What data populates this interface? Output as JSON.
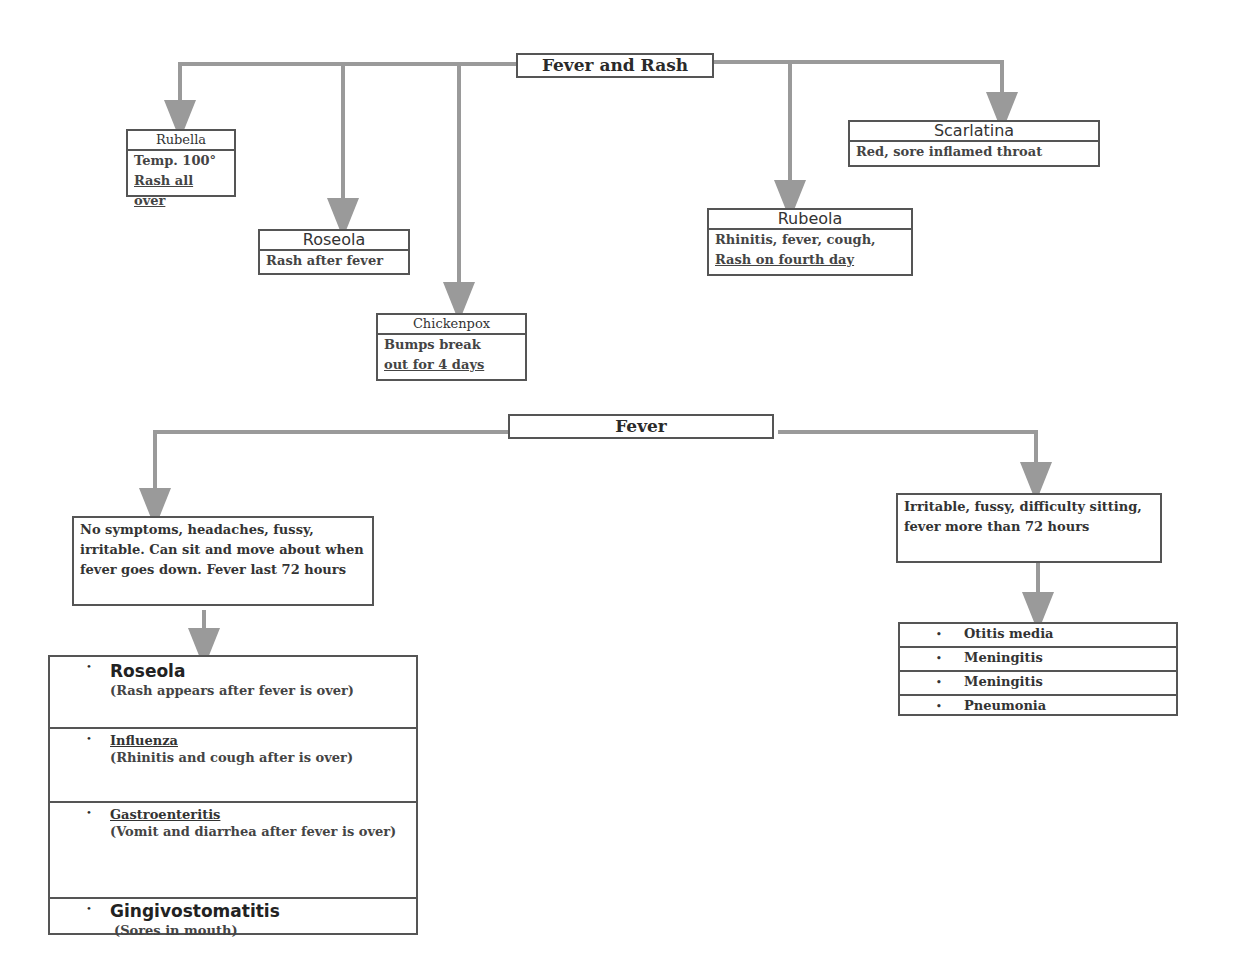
{
  "diagram": {
    "top": {
      "title": "Fever and Rash",
      "children": [
        {
          "name": "Rubella",
          "lines": [
            "Temp. 100°",
            "Rash all over"
          ]
        },
        {
          "name": "Roseola",
          "lines": [
            "Rash after fever"
          ]
        },
        {
          "name": "Chickenpox",
          "lines": [
            "Bumps break",
            "out for 4 days"
          ]
        },
        {
          "name": "Rubeola",
          "lines": [
            "Rhinitis, fever, cough,",
            "Rash on fourth day"
          ]
        },
        {
          "name": "Scarlatina",
          "lines": [
            "Red, sore inflamed throat"
          ]
        }
      ]
    },
    "bottom": {
      "title": "Fever",
      "left": {
        "description": "No symptoms, headaches, fussy, irritable.  Can sit and move about when fever goes down.  Fever last 72 hours",
        "bullet": "•",
        "items": [
          {
            "name": "Roseola",
            "desc": "(Rash appears after fever is over)"
          },
          {
            "name": "Influenza",
            "desc": "(Rhinitis and cough after is over)"
          },
          {
            "name": "Gastroenteritis",
            "desc": "(Vomit and diarrhea after fever is over)"
          },
          {
            "name": "Gingivostomatitis",
            "desc": "(Sores in mouth)"
          }
        ]
      },
      "right": {
        "description": "Irritable, fussy, difficulty sitting, fever more than 72 hours",
        "bullet": "•",
        "items": [
          "Otitis media",
          "Meningitis",
          "Meningitis",
          "Pneumonia"
        ]
      }
    }
  },
  "colors": {
    "line": "#9a9a9a",
    "border": "#555555"
  }
}
